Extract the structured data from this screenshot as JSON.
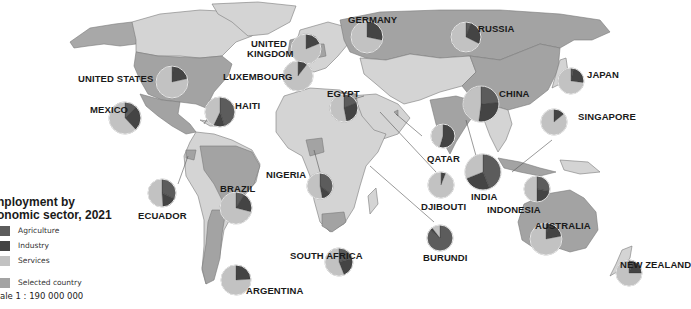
{
  "legend": {
    "title_line1": "nployment by",
    "title_line2": "onomic sector, 2021",
    "items": [
      {
        "label": "Agriculture",
        "color": "#5a5a5a"
      },
      {
        "label": "Industry",
        "color": "#474747"
      },
      {
        "label": "Services",
        "color": "#bdbdbd"
      },
      {
        "label": "Selected country",
        "color": "#9a9a9a"
      }
    ],
    "scale": "ale 1 : 190 000 000"
  },
  "colors": {
    "ocean": "#ffffff",
    "land": "#d4d4d4",
    "selected": "#9f9f9f",
    "border": "#6e6e6e",
    "agriculture": "#5c5c5c",
    "industry": "#444444",
    "services": "#c2c2c2",
    "pie_outline": "#e8e8e8"
  },
  "countries": [
    {
      "name": "UNITED STATES",
      "agriculture": 1.7,
      "industry": 19.9,
      "services": 78.4
    },
    {
      "name": "MEXICO",
      "agriculture": 12.5,
      "industry": 25.5,
      "services": 62.0
    },
    {
      "name": "HAITI",
      "agriculture": 45.0,
      "industry": 12.0,
      "services": 43.0
    },
    {
      "name": "ECUADOR",
      "agriculture": 32.0,
      "industry": 17.0,
      "services": 51.0
    },
    {
      "name": "BRAZIL",
      "agriculture": 9.0,
      "industry": 20.0,
      "services": 71.0
    },
    {
      "name": "ARGENTINA",
      "agriculture": 0.1,
      "industry": 24.0,
      "services": 75.9
    },
    {
      "name": "UNITED KINGDOM",
      "agriculture": 1.0,
      "industry": 17.8,
      "services": 81.2
    },
    {
      "name": "LUXEMBOURG",
      "agriculture": 0.9,
      "industry": 9.5,
      "services": 89.6
    },
    {
      "name": "GERMANY",
      "agriculture": 1.3,
      "industry": 27.0,
      "services": 71.7
    },
    {
      "name": "RUSSIA",
      "agriculture": 5.8,
      "industry": 26.7,
      "services": 67.5
    },
    {
      "name": "EGYPT",
      "agriculture": 19.0,
      "industry": 28.0,
      "services": 53.0
    },
    {
      "name": "NIGERIA",
      "agriculture": 35.0,
      "industry": 12.0,
      "services": 53.0
    },
    {
      "name": "QATAR",
      "agriculture": 1.2,
      "industry": 53.5,
      "services": 45.3
    },
    {
      "name": "DJIBOUTI",
      "agriculture": 1.0,
      "industry": 5.0,
      "services": 94.0
    },
    {
      "name": "BURUNDI",
      "agriculture": 86.0,
      "industry": 3.5,
      "services": 10.5
    },
    {
      "name": "SOUTH AFRICA",
      "agriculture": 21.0,
      "industry": 23.0,
      "services": 56.0
    },
    {
      "name": "INDIA",
      "agriculture": 44.0,
      "industry": 25.0,
      "services": 31.0
    },
    {
      "name": "CHINA",
      "agriculture": 24.0,
      "industry": 28.0,
      "services": 48.0
    },
    {
      "name": "JAPAN",
      "agriculture": 3.2,
      "industry": 23.8,
      "services": 73.0
    },
    {
      "name": "SINGAPORE",
      "agriculture": 0.1,
      "industry": 14.0,
      "services": 85.9
    },
    {
      "name": "INDONESIA",
      "agriculture": 28.0,
      "industry": 22.0,
      "services": 50.0
    },
    {
      "name": "AUSTRALIA",
      "agriculture": 2.5,
      "industry": 19.5,
      "services": 78.0
    },
    {
      "name": "NEW ZEALAND",
      "agriculture": 5.5,
      "industry": 19.5,
      "services": 75.0
    }
  ]
}
